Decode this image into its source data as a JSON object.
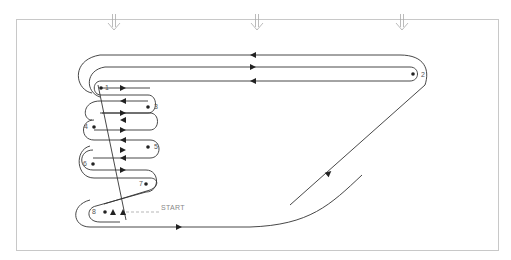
{
  "diagram": {
    "title": "",
    "frame": {
      "stroke": "#c8c8c8"
    },
    "path_color": "#333333",
    "guide_color": "#999999",
    "wind_arrows": [
      {
        "name": "wind-arrow-left",
        "x": 114
      },
      {
        "name": "wind-arrow-center",
        "x": 257
      },
      {
        "name": "wind-arrow-right",
        "x": 402
      }
    ],
    "waypoints": [
      {
        "id": "1",
        "label": "1",
        "x": 101,
        "y": 88
      },
      {
        "id": "2",
        "label": "2",
        "x": 413,
        "y": 74
      },
      {
        "id": "3",
        "label": "3",
        "x": 148,
        "y": 107
      },
      {
        "id": "4",
        "label": "4",
        "x": 94,
        "y": 127
      },
      {
        "id": "5",
        "label": "5",
        "x": 148,
        "y": 147
      },
      {
        "id": "6",
        "label": "6",
        "x": 93,
        "y": 164
      },
      {
        "id": "7",
        "label": "7",
        "x": 146,
        "y": 184
      },
      {
        "id": "8",
        "label": "8",
        "x": 105,
        "y": 212
      }
    ],
    "start_label": "START"
  }
}
